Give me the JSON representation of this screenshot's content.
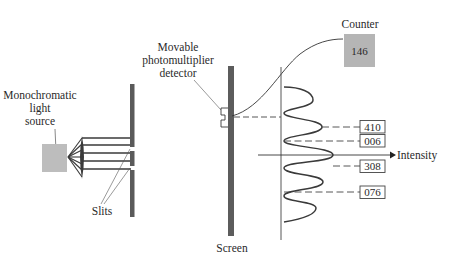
{
  "labels": {
    "light_source": [
      "Monochromatic",
      "light",
      "source"
    ],
    "slits": "Slits",
    "detector": [
      "Movable",
      "photomultiplier",
      "detector"
    ],
    "screen": "Screen",
    "counter": "Counter",
    "intensity": "Intensity"
  },
  "counter": {
    "value": "146"
  },
  "readings": [
    {
      "value": "410"
    },
    {
      "value": "006"
    },
    {
      "value": "308"
    },
    {
      "value": "076"
    }
  ],
  "colors": {
    "source_fill": "#bdbdbd",
    "counter_fill": "#b5b5b5",
    "barrier": "#5a5a5a",
    "screen": "#5c5c5c",
    "line": "#333333",
    "curve": "#3a3a3a"
  }
}
